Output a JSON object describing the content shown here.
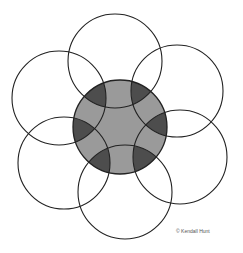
{
  "diagram": {
    "colors": {
      "stroke": "#222222",
      "center_fill": "#9a9a9a",
      "overlap_fill": "#4d4d4d",
      "background": "#ffffff"
    },
    "central_circle": {
      "cx": 120,
      "cy": 127,
      "r": 47
    },
    "outer_circles": [
      {
        "name": "top",
        "cx": 115,
        "cy": 61,
        "r": 47
      },
      {
        "name": "upper-right",
        "cx": 177,
        "cy": 91,
        "r": 46
      },
      {
        "name": "right",
        "cx": 180,
        "cy": 157,
        "r": 47
      },
      {
        "name": "bottom",
        "cx": 125,
        "cy": 192,
        "r": 47
      },
      {
        "name": "lower-left",
        "cx": 64,
        "cy": 163,
        "r": 46
      },
      {
        "name": "upper-left",
        "cx": 59,
        "cy": 98,
        "r": 47
      }
    ]
  },
  "copyright": "© Kendall Hunt"
}
